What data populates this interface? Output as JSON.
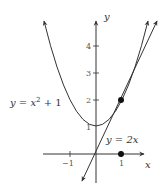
{
  "diagram": {
    "axes": {
      "x_label": "x",
      "y_label": "y",
      "x_ticks": [
        {
          "value": -1,
          "label": "−1"
        },
        {
          "value": 1,
          "label": "1"
        }
      ],
      "y_ticks": [
        {
          "value": 1,
          "label": "1"
        },
        {
          "value": 2,
          "label": "2"
        },
        {
          "value": 3,
          "label": "3"
        },
        {
          "value": 4,
          "label": "4"
        }
      ]
    },
    "curves": [
      {
        "name": "parabola",
        "label": "y = x² + 1",
        "equation": "y = x^2 + 1"
      },
      {
        "name": "tangent",
        "label": "y = 2x",
        "equation": "y = 2x"
      }
    ],
    "points": [
      {
        "name": "tangency-point",
        "x": 1,
        "y": 2
      },
      {
        "name": "x-axis-point",
        "x": 1,
        "y": 0
      }
    ],
    "colors": {
      "stroke": "#333333",
      "text": "#333333"
    }
  },
  "labels": {
    "parabola_eq_y": "y",
    "parabola_eq_eq": " = ",
    "parabola_eq_x": "x",
    "parabola_eq_sup": "2",
    "parabola_eq_rest": " + 1",
    "tangent_eq": "y = 2x",
    "x_axis": "x",
    "y_axis": "y",
    "tick_x_neg1": "−1",
    "tick_x_1": "1",
    "tick_y_1": "1",
    "tick_y_2": "2",
    "tick_y_3": "3",
    "tick_y_4": "4"
  }
}
